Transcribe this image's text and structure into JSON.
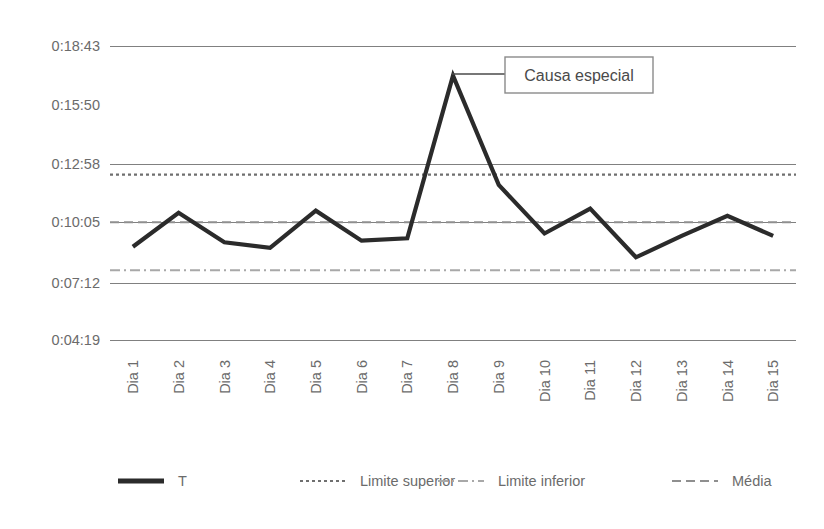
{
  "chart_data": {
    "type": "line",
    "title": "",
    "subtitle": "",
    "xlabel": "",
    "ylabel": "",
    "categories": [
      "Dia 1",
      "Dia 2",
      "Dia 3",
      "Dia 4",
      "Dia 5",
      "Dia 6",
      "Dia 7",
      "Dia 8",
      "Dia 9",
      "Dia 10",
      "Dia 11",
      "Dia 12",
      "Dia 13",
      "Dia 14",
      "Dia 15"
    ],
    "ytick_labels": [
      "0:18:43",
      "0:15:50",
      "0:12:58",
      "0:10:05",
      "0:07:12",
      "0:04:19"
    ],
    "ytick_seconds": [
      1123,
      950,
      778,
      605,
      432,
      259
    ],
    "ylim_seconds": [
      259,
      1123
    ],
    "grid": "horizontal",
    "gridlines_at": [
      "0:18:43",
      "0:12:58",
      "0:10:05",
      "0:07:12",
      "0:04:19"
    ],
    "legend_position": "bottom",
    "series": [
      {
        "name": "T",
        "style": "solid",
        "color": "#2b2b2b",
        "width": 4,
        "values": [
          "0:08:53",
          "0:10:33",
          "0:09:06",
          "0:08:50",
          "0:10:39",
          "0:09:11",
          "0:09:18",
          "0:17:16",
          "0:11:55",
          "0:09:32",
          "0:10:45",
          "0:08:22",
          "0:09:25",
          "0:10:24",
          "0:09:25"
        ],
        "values_seconds": [
          533,
          633,
          546,
          530,
          639,
          551,
          558,
          1036,
          715,
          572,
          645,
          502,
          565,
          624,
          565
        ]
      },
      {
        "name": "Limite superior",
        "style": "dotted",
        "color": "#6f6f6f",
        "width": 2,
        "constant": "0:12:25",
        "constant_seconds": 745
      },
      {
        "name": "Limite inferior",
        "style": "dashdot",
        "color": "#a8a8a8",
        "width": 2,
        "constant": "0:07:44",
        "constant_seconds": 464
      },
      {
        "name": "Média",
        "style": "dashed",
        "color": "#8f8f8f",
        "width": 2,
        "constant": "0:10:05",
        "constant_seconds": 605
      }
    ],
    "annotations": [
      {
        "text": "Causa especial",
        "points_to_category": "Dia 8",
        "points_to_value": "0:17:16",
        "boxed": true
      }
    ]
  },
  "legend": {
    "items": [
      {
        "label": "T"
      },
      {
        "label": "Limite superior"
      },
      {
        "label": "Limite inferior"
      },
      {
        "label": "Média"
      }
    ]
  }
}
